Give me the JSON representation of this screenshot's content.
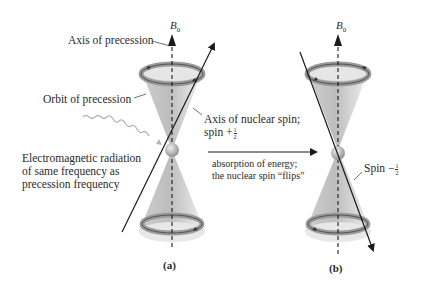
{
  "figure": {
    "panels": [
      {
        "id": "a",
        "label": "(a)",
        "field_label": "B",
        "field_sub": "0",
        "spin_state": "+1/2",
        "spin_direction": "up-right"
      },
      {
        "id": "b",
        "label": "(b)",
        "field_label": "B",
        "field_sub": "0",
        "spin_state": "-1/2",
        "spin_direction": "down-right"
      }
    ],
    "annotations": {
      "axis_of_precession": "Axis of precession",
      "orbit_of_precession": "Orbit of precession",
      "axis_of_nuclear_spin_line1": "Axis of nuclear spin;",
      "axis_of_nuclear_spin_line2_prefix": "spin +",
      "em_radiation_line1": "Electromagnetic radiation",
      "em_radiation_line2": "of same frequency as",
      "em_radiation_line3": "precession frequency",
      "absorption_line1": "absorption of energy;",
      "absorption_line2": "the nuclear spin “flips”",
      "spin_minus_prefix": "Spin −",
      "frac_num": "1",
      "frac_den": "2"
    },
    "colors": {
      "cone_fill": "#d9d9d9",
      "cone_dark": "#b8b8b8",
      "ring_fill": "#a9a9a9",
      "line": "#1a1a1a",
      "wave": "#b5b5b5",
      "text": "#2a2a2a"
    }
  }
}
